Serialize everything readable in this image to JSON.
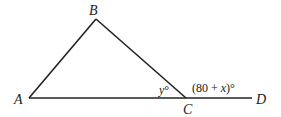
{
  "diagram": {
    "points": {
      "A": {
        "label": "A"
      },
      "B": {
        "label": "B"
      },
      "C": {
        "label": "C"
      },
      "D": {
        "label": "D"
      }
    },
    "angles": {
      "interior_C": {
        "var": "y",
        "deg": "°"
      },
      "exterior_C": {
        "open": "(80 + ",
        "var": "x",
        "close": ")°"
      }
    },
    "segments": [
      "AB",
      "BC",
      "AD"
    ],
    "colors": {
      "line": "#222222",
      "background": "#ffffff"
    }
  }
}
